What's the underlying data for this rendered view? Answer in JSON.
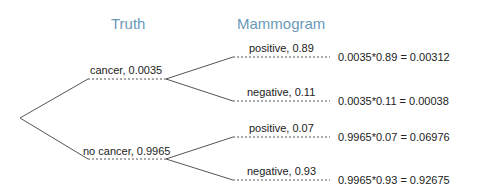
{
  "titles": {
    "truth": "Truth",
    "mammogram": "Mammogram"
  },
  "colors": {
    "title": "#6a9ab8",
    "line": "#555555",
    "text": "#222222"
  },
  "tree": {
    "root": {},
    "branches": [
      {
        "label": "cancer,  0.0035",
        "children": [
          {
            "label": "positive,  0.89",
            "result": "0.0035*0.89  =  0.00312"
          },
          {
            "label": "negative,  0.11",
            "result": "0.0035*0.11  =  0.00038"
          }
        ]
      },
      {
        "label": "no cancer,  0.9965",
        "children": [
          {
            "label": "positive,  0.07",
            "result": "0.9965*0.07  =  0.06976"
          },
          {
            "label": "negative,  0.93",
            "result": "0.9965*0.93  =  0.92675"
          }
        ]
      }
    ]
  }
}
